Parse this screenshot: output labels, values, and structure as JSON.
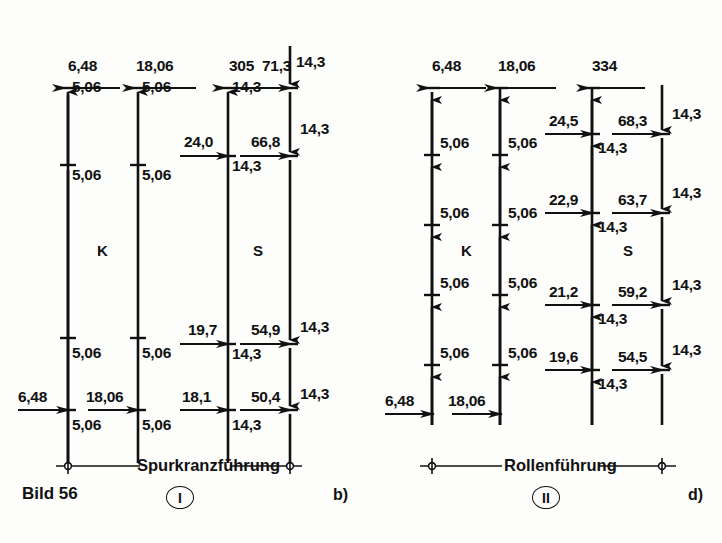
{
  "figure": {
    "bild_label": "Bild 56",
    "panel_b_label": "b)",
    "panel_d_label": "d)"
  },
  "left_diagram": {
    "caption": "Spurkranzführung",
    "roman": "I",
    "zone_k": "K",
    "zone_s": "S",
    "col1": {
      "top_h": "6,48",
      "segments": [
        "5,06",
        "5,06",
        "5,06",
        "5,06"
      ],
      "bottom_h": "6,48"
    },
    "col2": {
      "top_h": "18,06",
      "segments": [
        "5,06",
        "5,06",
        "5,06",
        "5,06"
      ],
      "bottom_h": "18,06"
    },
    "col3": {
      "top_h": "305",
      "h_mid_upper": "24,0",
      "h_mid_lower": "19,7",
      "h_bottom": "18,1",
      "segments": [
        "14,3",
        "14,3",
        "14,3",
        "14,3"
      ]
    },
    "col4": {
      "top_h": "71,3",
      "h2": "66,8",
      "h3": "54,9",
      "h4": "50,4",
      "segments": [
        "14,3",
        "14,3",
        "14,3",
        "14,3"
      ]
    }
  },
  "right_diagram": {
    "caption": "Rollenführung",
    "roman": "II",
    "zone_k": "K",
    "zone_s": "S",
    "col1": {
      "top_h": "6,48",
      "segments": [
        "5,06",
        "5,06",
        "5,06",
        "5,06"
      ],
      "bottom_h": "6,48"
    },
    "col2": {
      "top_h": "18,06",
      "segments": [
        "5,06",
        "5,06",
        "5,06",
        "5,06"
      ],
      "bottom_h": "18,06"
    },
    "col3": {
      "top_h": "334",
      "h2": "24,5",
      "h3": "22,9",
      "h4": "21,2",
      "h5": "19,6",
      "segments": [
        "14,3",
        "14,3",
        "14,3",
        "14,3"
      ]
    },
    "col4": {
      "h1": "68,3",
      "h2": "63,7",
      "h3": "59,2",
      "h4": "54,5",
      "segments": [
        "14,3",
        "14,3",
        "14,3",
        "14,3"
      ]
    }
  },
  "colors": {
    "ink": "#111111",
    "background": "#fdfdfb"
  }
}
